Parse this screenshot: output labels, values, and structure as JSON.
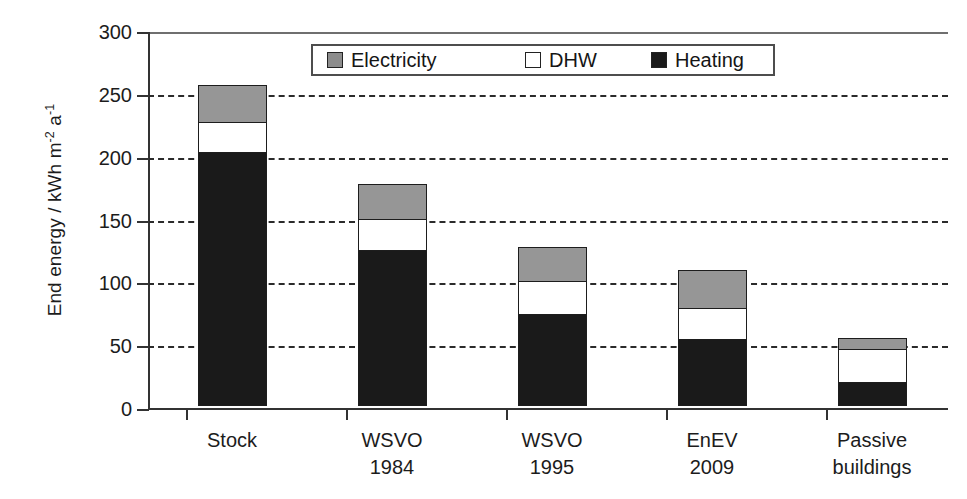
{
  "chart_data": {
    "type": "bar",
    "subtype": "stacked-vertical",
    "title": "",
    "xlabel": "",
    "ylabel": "End energy / kWh m-2 a-1",
    "ylabel_parts": {
      "prefix": "End energy / kWh m",
      "sup1": "-2",
      "mid": " a",
      "sup2": "-1"
    },
    "categories": [
      "Stock",
      "WSVO\n1984",
      "WSVO\n1995",
      "EnEV\n2009",
      "Passive\nbuildings"
    ],
    "category_labels_flat": [
      "Stock",
      "WSVO 1984",
      "WSVO 1995",
      "EnEV 2009",
      "Passive buildings"
    ],
    "series": [
      {
        "name": "Heating",
        "color": "#1a1a1a",
        "values": [
          202,
          124,
          73,
          53,
          19
        ]
      },
      {
        "name": "DHW",
        "color": "#ffffff",
        "values": [
          25,
          26,
          27,
          26,
          27
        ]
      },
      {
        "name": "Electricity",
        "color": "#969696",
        "values": [
          30,
          28,
          28,
          31,
          10
        ]
      }
    ],
    "totals": [
      257,
      178,
      128,
      110,
      56
    ],
    "ylim": [
      0,
      300
    ],
    "yticks": [
      0,
      50,
      100,
      150,
      200,
      250,
      300
    ],
    "ytick_labels": [
      "0",
      "50",
      "100",
      "150",
      "200",
      "250",
      "300"
    ],
    "grid": "horizontal-dashed",
    "legend_position": "top-center-inside",
    "legend_entries": [
      {
        "label": "Electricity",
        "color": "#969696"
      },
      {
        "label": "DHW",
        "color": "#ffffff"
      },
      {
        "label": "Heating",
        "color": "#1a1a1a"
      }
    ]
  }
}
